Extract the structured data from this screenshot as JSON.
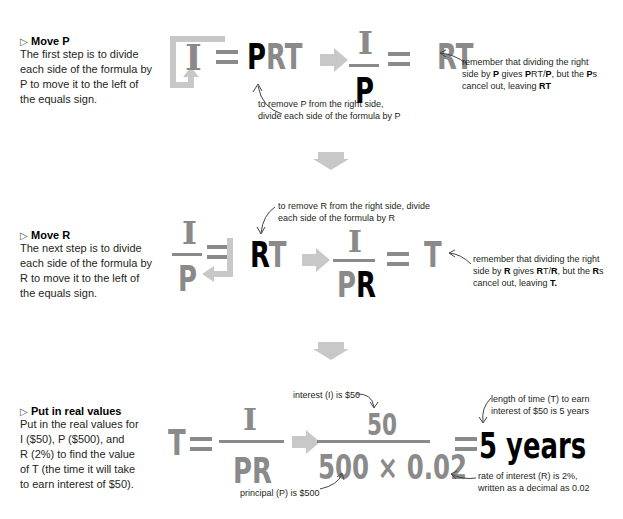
{
  "steps": [
    {
      "title": "Move P",
      "body_lines": [
        "The first step is to divide",
        "each side of the formula by",
        "P to move it to the left of",
        "the equals sign."
      ]
    },
    {
      "title": "Move R",
      "body_lines": [
        "The next step is to divide",
        "each side of the formula by",
        "R to move it to the left of",
        "the equals sign."
      ]
    },
    {
      "title": "Put in real values",
      "body_lines": [
        "Put in the real values for",
        "I ($50), P ($500), and",
        "R (2%) to find the value",
        "of T (the time it will take",
        "to earn interest of $50)."
      ]
    }
  ],
  "formulas": {
    "step1": {
      "lhs": "I",
      "eq": "=",
      "p": "P",
      "rt": "RT",
      "num": "I",
      "den": "P",
      "result": "RT"
    },
    "step2": {
      "num": "I",
      "den": "P",
      "r": "R",
      "t": "T",
      "num2": "I",
      "den2_p": "P",
      "den2_r": "R",
      "result": "T"
    },
    "step3": {
      "t": "T",
      "num": "I",
      "den": "PR",
      "num_val": "50",
      "den_val": "500 × 0.02",
      "result": "5 years"
    }
  },
  "notes": {
    "step1_remove": [
      "to remove P from the right side,",
      "divide each side of the formula by P"
    ],
    "step1_remember": {
      "l1": "remember that dividing the right",
      "l2a": "side by ",
      "l2b": "P",
      "l2c": " gives ",
      "l2d": "P",
      "l2e": "RT/",
      "l2f": "P",
      "l2g": ", but the ",
      "l2h": "P",
      "l2i": "s",
      "l3a": "cancel out, leaving ",
      "l3b": "RT"
    },
    "step2_remove": [
      "to remove R from the right side, divide",
      "each side of the formula by R"
    ],
    "step2_remember": {
      "l1": "remember that dividing the right",
      "l2a": "side by ",
      "l2b": "R",
      "l2c": " gives ",
      "l2d": "R",
      "l2e": "T/",
      "l2f": "R",
      "l2g": ", but the ",
      "l2h": "R",
      "l2i": "s",
      "l3a": "cancel out, leaving ",
      "l3b": "T."
    },
    "interest": "interest (I) is $50",
    "principal": "principal (P) is $500",
    "time": [
      "length of time (T) to earn",
      "interest of $50 is 5 years"
    ],
    "rate": [
      "rate of interest (R) is 2%,",
      "written as a decimal as 0.02"
    ]
  },
  "icons": {
    "step_marker": "▷"
  },
  "colors": {
    "formula_gray": "#8a8a8a",
    "arrow_gray": "#c8c8c8",
    "emphasis_black": "#000000"
  }
}
